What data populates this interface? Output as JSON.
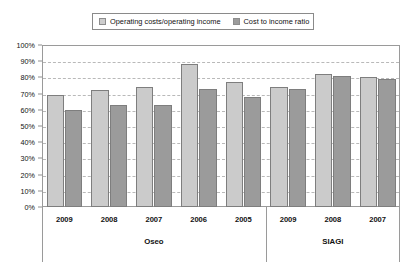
{
  "chart_data": {
    "type": "bar",
    "title": "",
    "xlabel": "",
    "ylabel": "",
    "ylim": [
      0,
      100
    ],
    "yticks": [
      "0%",
      "10%",
      "20%",
      "30%",
      "40%",
      "50%",
      "60%",
      "70%",
      "80%",
      "90%",
      "100%"
    ],
    "grid": true,
    "legend_position": "top-center",
    "categories": [
      "2009",
      "2008",
      "2007",
      "2006",
      "2005",
      "2009",
      "2008",
      "2007"
    ],
    "groups": [
      {
        "name": "Oseo",
        "categories": [
          "2009",
          "2008",
          "2007",
          "2006",
          "2005"
        ]
      },
      {
        "name": "SIAGI",
        "categories": [
          "2009",
          "2008",
          "2007"
        ]
      }
    ],
    "series": [
      {
        "name": "Operating costs/operating income",
        "color": "#cbcbcb",
        "values": [
          69,
          72,
          74,
          88,
          77,
          74,
          82,
          80
        ]
      },
      {
        "name": "Cost to income ratio",
        "color": "#9b9b9b",
        "values": [
          60,
          63,
          63,
          73,
          68,
          73,
          81,
          79
        ]
      }
    ]
  },
  "legend": {
    "entries": [
      {
        "label": "Operating costs/operating income",
        "color": "#cbcbcb"
      },
      {
        "label": "Cost to income ratio",
        "color": "#9b9b9b"
      }
    ]
  },
  "axis": {
    "y_ticks": [
      "100%",
      "90%",
      "80%",
      "70%",
      "60%",
      "50%",
      "40%",
      "30%",
      "20%",
      "10%",
      "0%"
    ]
  }
}
